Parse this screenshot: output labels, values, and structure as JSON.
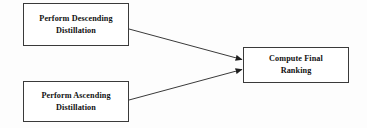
{
  "diagram": {
    "background_color": "#fdfdfd",
    "line_color": "#3a3a3a",
    "text_color": "#111111",
    "nodes": [
      {
        "id": "descending",
        "label": "Perform Descending\nDistillation",
        "shape": "rectangle"
      },
      {
        "id": "ascending",
        "label": "Perform Ascending\nDistillation",
        "shape": "rectangle"
      },
      {
        "id": "compute",
        "label": "Compute Final\nRanking",
        "shape": "rectangle"
      }
    ],
    "edges": [
      {
        "id": "descending-to-compute",
        "from": "descending",
        "to": "compute",
        "label": "",
        "arrow": "filled-triangle"
      },
      {
        "id": "ascending-to-compute",
        "from": "ascending",
        "to": "compute",
        "label": "",
        "arrow": "filled-triangle"
      }
    ]
  }
}
